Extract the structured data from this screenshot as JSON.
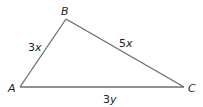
{
  "diagram": {
    "type": "triangle",
    "vertices": {
      "A": {
        "label": "A",
        "x": 20,
        "y": 87
      },
      "B": {
        "label": "B",
        "x": 66,
        "y": 19
      },
      "C": {
        "label": "C",
        "x": 184,
        "y": 87
      }
    },
    "sides": {
      "AB": {
        "coef": "3",
        "var": "x"
      },
      "BC": {
        "coef": "5",
        "var": "x"
      },
      "AC": {
        "coef": "3",
        "var": "y"
      }
    },
    "line_color": "#6b6b6b",
    "text_color": "#222222"
  }
}
